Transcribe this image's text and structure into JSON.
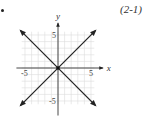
{
  "figure": {
    "reference_label": "(2-1)"
  },
  "chart_data": {
    "type": "line",
    "title": "",
    "xlabel": "x",
    "ylabel": "y",
    "xlim": [
      -6,
      6
    ],
    "ylim": [
      -6,
      6
    ],
    "grid": true,
    "x_tick_labels": [
      "-5",
      "5"
    ],
    "y_tick_labels": [
      "5",
      "-5"
    ],
    "series": [
      {
        "name": "y = x",
        "x": [
          -6,
          6
        ],
        "y": [
          -6,
          6
        ],
        "arrows": "both"
      },
      {
        "name": "y = -x",
        "x": [
          -6,
          6
        ],
        "y": [
          6,
          -6
        ],
        "arrows": "both"
      }
    ],
    "colors": {
      "line": "#222222",
      "grid": "#dcdcdc",
      "axis": "#333333"
    }
  }
}
